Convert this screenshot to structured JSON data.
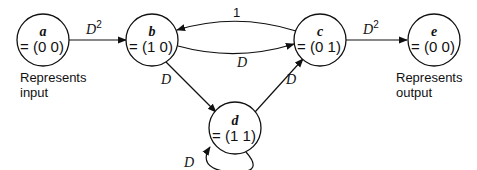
{
  "diagram": {
    "type": "state-transition",
    "nodes": [
      {
        "id": "a",
        "name": "a",
        "value": "= (0 0)"
      },
      {
        "id": "b",
        "name": "b",
        "value": "= (1 0)"
      },
      {
        "id": "c",
        "name": "c",
        "value": "= (0 1)"
      },
      {
        "id": "d",
        "name": "d",
        "value": "= (1 1)"
      },
      {
        "id": "e",
        "name": "e",
        "value": "= (0 0)"
      }
    ],
    "edges": [
      {
        "from": "a",
        "to": "b",
        "label": "D",
        "exponent": "2"
      },
      {
        "from": "c",
        "to": "b",
        "label": "1"
      },
      {
        "from": "b",
        "to": "c",
        "label": "D"
      },
      {
        "from": "b",
        "to": "d",
        "label": "D"
      },
      {
        "from": "d",
        "to": "c",
        "label": "D"
      },
      {
        "from": "d",
        "to": "d",
        "label": "D"
      },
      {
        "from": "c",
        "to": "e",
        "label": "D",
        "exponent": "2"
      }
    ],
    "notes": {
      "input": {
        "line1": "Represents",
        "line2": "input"
      },
      "output": {
        "line1": "Represents",
        "line2": "output"
      }
    }
  }
}
